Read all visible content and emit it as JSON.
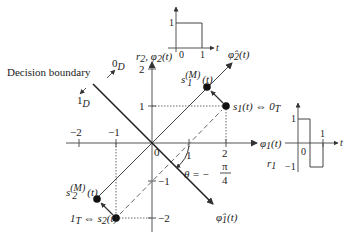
{
  "diagram": {
    "type": "signal-space-constellation",
    "labels": {
      "decision_boundary": "Decision boundary",
      "zero_d": "0",
      "zero_d_sub": "D",
      "one_d": "1",
      "one_d_sub": "D",
      "phi2_axis": "r",
      "phi2_axis_sub": "2",
      "phi2_axis_rest": ", φ",
      "phi2_axis_rest_sub": "2",
      "phi2_axis_arg": "(t)",
      "phi1_axis": "φ",
      "phi1_axis_sub": "1",
      "phi1_axis_arg": "(t)",
      "r1": "r",
      "r1_sub": "1",
      "phi2_hat": "φ̂",
      "phi2_hat_sub": "2",
      "phi2_hat_arg": "(t)",
      "phi1_hat": "φ̂",
      "phi1_hat_sub": "1",
      "phi1_hat_arg": "(t)",
      "s1": "s",
      "s1_sub": "1",
      "s1_rest": "(t) ⇔ 0",
      "s1_rest_sub": "T",
      "s2_prefix": "1",
      "s2_prefix_sub": "T",
      "s2_rest": " ⇔ s",
      "s2_sub": "2",
      "s2_arg": "(t)",
      "s1m": "s",
      "s1m_sub": "1",
      "s1m_sup": "(M)",
      "s1m_arg": "(t)",
      "s2m": "s",
      "s2m_sub": "2",
      "s2m_sup": "(M)",
      "s2m_arg": "(t)",
      "theta": "θ = −",
      "theta_num": "π",
      "theta_den": "4",
      "origin": "0",
      "x_ticks": [
        "−2",
        "−1",
        "1",
        "2"
      ],
      "y_ticks": [
        "2",
        "1",
        "−1",
        "−2"
      ],
      "frac_two_num": "2",
      "frac_two_den": "",
      "inset_top": {
        "y1": "1",
        "x0": "0",
        "x1": "1",
        "t": "t"
      },
      "inset_right": {
        "y1": "1",
        "ym1": "−1",
        "x0": "0",
        "x1": "1",
        "t": "t"
      }
    },
    "points": {
      "s1": [
        2,
        1
      ],
      "s2": [
        -1,
        -2
      ],
      "s1_M": [
        1.5,
        1.5
      ],
      "s2_M": [
        -1.5,
        -1.5
      ]
    },
    "rotation_angle": "-π/4"
  }
}
